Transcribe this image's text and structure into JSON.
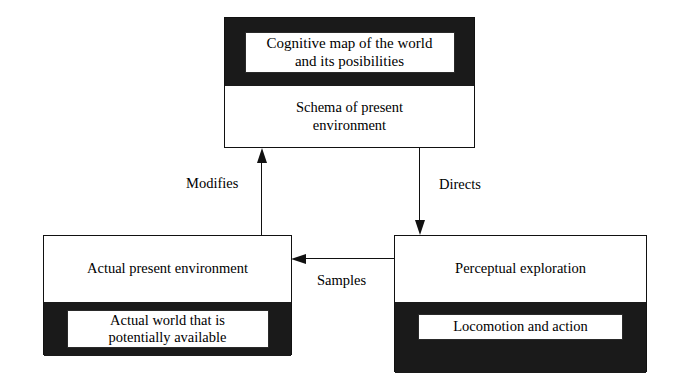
{
  "diagram": {
    "type": "flow-diagram",
    "background_color": "#ffffff",
    "line_color": "#111111",
    "band_color": "#1a1a1a",
    "nodes": [
      {
        "id": "cognitive",
        "black_band_label": "Cognitive map of the world and its posibilities",
        "black_band_line1": "Cognitive map of the world",
        "black_band_line2": "and its posibilities",
        "white_band_label": "Schema of present environment",
        "white_band_line1": "Schema of present",
        "white_band_line2": "environment"
      },
      {
        "id": "actual",
        "white_band_label": "Actual present environment",
        "black_band_label": "Actual world that is potentially available",
        "black_band_line1": "Actual world that is",
        "black_band_line2": "potentially available"
      },
      {
        "id": "perceptual",
        "white_band_label": "Perceptual exploration",
        "black_band_label": "Locomotion and action"
      }
    ],
    "edges": [
      {
        "id": "modifies",
        "label": "Modifies",
        "from": "actual",
        "to": "cognitive",
        "direction": "up"
      },
      {
        "id": "directs",
        "label": "Directs",
        "from": "cognitive",
        "to": "perceptual",
        "direction": "down"
      },
      {
        "id": "samples",
        "label": "Samples",
        "from": "perceptual",
        "to": "actual",
        "direction": "left"
      }
    ]
  }
}
